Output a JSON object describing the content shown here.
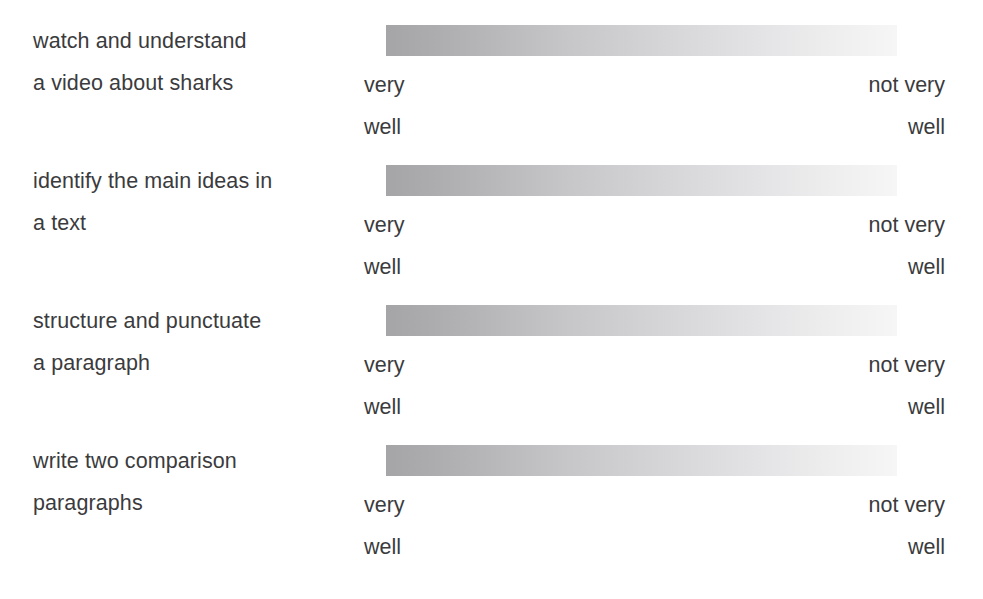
{
  "worksheet": {
    "title": "Self-assessment confidence scale worksheet",
    "scale": {
      "left_label": "very\nwell",
      "right_label": "not very\nwell",
      "gradient_start_color": "#a5a5a7",
      "gradient_end_color": "#f6f6f6",
      "direction": "left-to-right"
    },
    "text_color": "#3b3b3d",
    "background_color": "#ffffff",
    "rows": [
      {
        "skill": "watch and understand\na video about sharks",
        "left_label": "very\nwell",
        "right_label": "not very\nwell"
      },
      {
        "skill": "identify the main ideas in\na text",
        "left_label": "very\nwell",
        "right_label": "not very\nwell"
      },
      {
        "skill": "structure and punctuate\na paragraph",
        "left_label": "very\nwell",
        "right_label": "not very\nwell"
      },
      {
        "skill": "write two comparison\nparagraphs",
        "left_label": "very\nwell",
        "right_label": "not very\nwell"
      }
    ]
  }
}
